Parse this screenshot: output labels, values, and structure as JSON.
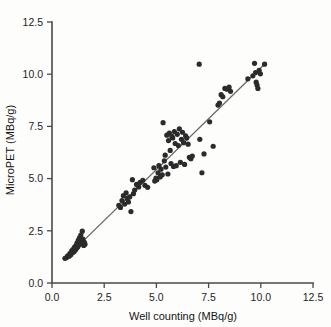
{
  "figure": {
    "kind": "scatter-plot-with-regression-line",
    "background_color": "#fdfdfc",
    "point_color": "#2b2b2b",
    "line_color": "#6a6a6a",
    "axis_color": "#4a4a4a"
  },
  "chart_data": {
    "type": "scatter",
    "title": "",
    "xlabel": "Well counting (MBq/g)",
    "ylabel": "MicroPET (MBq/g)",
    "xlim": [
      0.0,
      12.5
    ],
    "ylim": [
      0.0,
      12.5
    ],
    "xticks": [
      0.0,
      2.5,
      5.0,
      7.5,
      10.0,
      12.5
    ],
    "yticks": [
      0.0,
      2.5,
      5.0,
      7.5,
      10.0,
      12.5
    ],
    "xtick_labels": [
      "0.0",
      "2.5",
      "5.0",
      "7.5",
      "10.0",
      "12.5"
    ],
    "ytick_labels": [
      "0.0",
      "2.5",
      "5.0",
      "7.5",
      "10.0",
      "12.5"
    ],
    "grid": false,
    "legend": null,
    "annotations": [],
    "series": [
      {
        "name": "Tissue samples",
        "marker": "filled-circle",
        "marker_size": 2.6,
        "color": "#2b2b2b",
        "points": [
          [
            0.62,
            1.18
          ],
          [
            0.7,
            1.22
          ],
          [
            0.75,
            1.3
          ],
          [
            0.82,
            1.28
          ],
          [
            0.86,
            1.42
          ],
          [
            0.9,
            1.35
          ],
          [
            0.95,
            1.55
          ],
          [
            0.98,
            1.45
          ],
          [
            1.02,
            1.62
          ],
          [
            1.05,
            1.5
          ],
          [
            1.08,
            1.72
          ],
          [
            1.12,
            1.58
          ],
          [
            1.15,
            1.8
          ],
          [
            1.18,
            1.66
          ],
          [
            1.2,
            1.92
          ],
          [
            1.24,
            1.74
          ],
          [
            1.26,
            2.05
          ],
          [
            1.3,
            1.84
          ],
          [
            1.32,
            2.18
          ],
          [
            1.35,
            1.95
          ],
          [
            1.38,
            2.3
          ],
          [
            1.4,
            2.02
          ],
          [
            1.42,
            1.88
          ],
          [
            1.45,
            2.48
          ],
          [
            1.48,
            2.1
          ],
          [
            1.52,
            1.8
          ],
          [
            1.55,
            1.95
          ],
          [
            1.58,
            1.86
          ],
          [
            3.2,
            3.72
          ],
          [
            3.28,
            3.62
          ],
          [
            3.35,
            3.95
          ],
          [
            3.42,
            4.18
          ],
          [
            3.48,
            3.78
          ],
          [
            3.55,
            4.32
          ],
          [
            3.6,
            4.05
          ],
          [
            3.66,
            3.88
          ],
          [
            3.72,
            4.12
          ],
          [
            3.78,
            3.42
          ],
          [
            3.85,
            4.95
          ],
          [
            3.9,
            4.28
          ],
          [
            3.96,
            4.45
          ],
          [
            4.05,
            4.72
          ],
          [
            4.15,
            4.6
          ],
          [
            4.22,
            4.82
          ],
          [
            4.35,
            4.92
          ],
          [
            4.45,
            4.68
          ],
          [
            4.58,
            4.58
          ],
          [
            4.88,
            5.52
          ],
          [
            4.92,
            4.88
          ],
          [
            4.98,
            5.02
          ],
          [
            5.02,
            4.95
          ],
          [
            5.08,
            5.28
          ],
          [
            5.12,
            5.62
          ],
          [
            5.18,
            5.08
          ],
          [
            5.22,
            5.45
          ],
          [
            5.28,
            5.18
          ],
          [
            5.32,
            7.68
          ],
          [
            5.38,
            5.85
          ],
          [
            5.42,
            6.12
          ],
          [
            5.45,
            5.55
          ],
          [
            5.5,
            7.08
          ],
          [
            5.55,
            5.22
          ],
          [
            5.58,
            6.82
          ],
          [
            5.62,
            7.18
          ],
          [
            5.66,
            6.35
          ],
          [
            5.7,
            5.72
          ],
          [
            5.74,
            7.02
          ],
          [
            5.78,
            6.95
          ],
          [
            5.82,
            5.58
          ],
          [
            5.86,
            7.25
          ],
          [
            5.9,
            6.68
          ],
          [
            5.95,
            5.62
          ],
          [
            6.0,
            7.12
          ],
          [
            6.05,
            6.58
          ],
          [
            6.1,
            7.38
          ],
          [
            6.15,
            5.78
          ],
          [
            6.2,
            6.88
          ],
          [
            6.25,
            7.22
          ],
          [
            6.3,
            6.72
          ],
          [
            6.35,
            5.68
          ],
          [
            6.4,
            7.05
          ],
          [
            6.45,
            6.95
          ],
          [
            6.52,
            6.65
          ],
          [
            6.58,
            6.02
          ],
          [
            6.65,
            5.95
          ],
          [
            6.72,
            6.08
          ],
          [
            7.05,
            10.48
          ],
          [
            7.08,
            6.88
          ],
          [
            7.18,
            5.28
          ],
          [
            7.28,
            6.18
          ],
          [
            7.55,
            7.72
          ],
          [
            7.72,
            6.55
          ],
          [
            7.95,
            8.52
          ],
          [
            8.02,
            8.62
          ],
          [
            8.1,
            9.02
          ],
          [
            8.18,
            8.92
          ],
          [
            8.28,
            9.32
          ],
          [
            8.38,
            9.28
          ],
          [
            8.48,
            9.38
          ],
          [
            8.55,
            9.18
          ],
          [
            9.38,
            9.78
          ],
          [
            9.62,
            9.92
          ],
          [
            9.7,
            10.52
          ],
          [
            9.75,
            10.08
          ],
          [
            9.78,
            9.62
          ],
          [
            9.82,
            9.48
          ],
          [
            9.86,
            9.32
          ],
          [
            9.92,
            10.18
          ],
          [
            9.98,
            10.02
          ],
          [
            10.18,
            10.48
          ]
        ]
      }
    ],
    "fit_line": {
      "name": "regression line",
      "x_start": 0.58,
      "y_start": 1.12,
      "x_end": 10.25,
      "y_end": 10.55,
      "color": "#6a6a6a"
    }
  }
}
